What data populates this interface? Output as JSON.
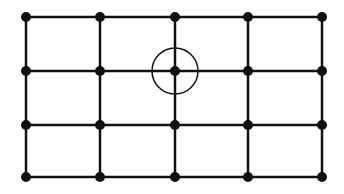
{
  "diagram": {
    "type": "grid-graph",
    "width": 344,
    "height": 194,
    "background": "#ffffff",
    "colors": {
      "line": "#111111",
      "node": "#111111",
      "highlight_circle": "#111111"
    },
    "grid": {
      "columns": 5,
      "rows": 4,
      "column_x": [
        26,
        100,
        175,
        248,
        322
      ],
      "row_y": [
        17,
        71,
        125,
        177
      ],
      "line_width": 2.5,
      "node_radius": 5
    },
    "highlight": {
      "description": "circle around node at column 3, row 2",
      "column_index": 2,
      "row_index": 1,
      "cx": 175,
      "cy": 71,
      "r": 23,
      "stroke_width": 1.5
    }
  }
}
